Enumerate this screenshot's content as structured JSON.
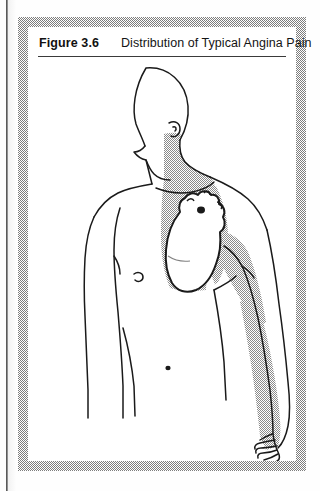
{
  "figure": {
    "number_label": "Figure 3.6",
    "title": "Distribution of Typical Angina Pain"
  },
  "illustration": {
    "name": "angina-pain-distribution-diagram",
    "description": "Line drawing of a human head, torso and left arm in three-quarter view with stippled shading showing the typical radiation of angina pain",
    "view": "anterior torso, head turned in profile to the viewer's left",
    "shaded_regions": [
      "right side of neck and jaw",
      "central chest over the heart (substernal)",
      "left axilla",
      "medial aspect of left upper arm",
      "medial aspect of left forearm",
      "ulnar side of left hand and fingers"
    ],
    "anatomical_features": [
      "head in profile",
      "ear",
      "neck",
      "shoulders",
      "right nipple",
      "heart outline with great vessels",
      "navel",
      "left arm",
      "left hand with five fingers"
    ],
    "colors": {
      "ink": "#1a1a1a",
      "shading_halftone": "#8c8c8c",
      "skin_fill": "#ffffff",
      "frame_halftone": "#7d7d7d",
      "page": "#ffffff"
    }
  }
}
